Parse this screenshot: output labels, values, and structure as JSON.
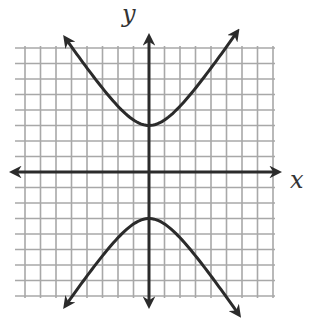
{
  "chart_data": {
    "type": "line",
    "title": "",
    "xlabel": "x",
    "ylabel": "y",
    "xlim": [
      -9,
      8
    ],
    "ylim": [
      -8,
      8
    ],
    "grid": true,
    "grid_unit_px": 15.5,
    "origin_px": [
      149,
      172
    ],
    "equation": "y^2/9 - x^2/4 = 1",
    "series": [
      {
        "name": "upper-branch",
        "x": [
          -5.6,
          -4,
          -3,
          -2,
          -1,
          0,
          1,
          2,
          3,
          4,
          5.8
        ],
        "y": [
          8.9,
          6.71,
          5.41,
          4.24,
          3.35,
          3,
          3.35,
          4.24,
          5.41,
          6.71,
          9.15
        ],
        "arrows": [
          "start",
          "end"
        ]
      },
      {
        "name": "lower-branch",
        "x": [
          -5.6,
          -4,
          -3,
          -2,
          -1,
          0,
          1,
          2,
          3,
          4,
          5.9
        ],
        "y": [
          -8.9,
          -6.71,
          -5.41,
          -4.24,
          -3.35,
          -3,
          -3.35,
          -4.24,
          -5.41,
          -6.71,
          -9.3
        ],
        "arrows": [
          "start",
          "end"
        ]
      }
    ],
    "vertices": [
      [
        0,
        3
      ],
      [
        0,
        -3
      ]
    ],
    "colors": {
      "curve": "#2b2b2b",
      "axis": "#2b2b2b",
      "grid": "#a8a8a8",
      "background": "#ffffff"
    }
  },
  "labels": {
    "x_axis": "x",
    "y_axis": "y"
  }
}
